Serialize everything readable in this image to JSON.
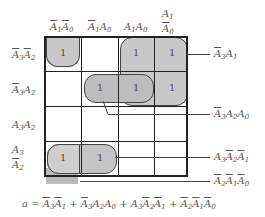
{
  "kmap": {
    "col_headers": [
      {
        "parts": [
          {
            "t": "A",
            "sub": "1",
            "bar": true
          },
          {
            "t": "A",
            "sub": "0",
            "bar": true
          }
        ]
      },
      {
        "parts": [
          {
            "t": "A",
            "sub": "1",
            "bar": true
          },
          {
            "t": "A",
            "sub": "0",
            "bar": false
          }
        ]
      },
      {
        "parts": [
          {
            "t": "A",
            "sub": "1",
            "bar": false
          },
          {
            "t": "A",
            "sub": "0",
            "bar": false
          }
        ]
      },
      {
        "parts": [
          {
            "t": "A",
            "sub": "1",
            "bar": false
          },
          {
            "t": "A",
            "sub": "0",
            "bar": true
          }
        ]
      }
    ],
    "row_headers": [
      {
        "parts": [
          {
            "t": "A",
            "sub": "3",
            "bar": true
          },
          {
            "t": "A",
            "sub": "2",
            "bar": true
          }
        ]
      },
      {
        "parts": [
          {
            "t": "A",
            "sub": "3",
            "bar": true
          },
          {
            "t": "A",
            "sub": "2",
            "bar": false
          }
        ]
      },
      {
        "parts": [
          {
            "t": "A",
            "sub": "3",
            "bar": false
          },
          {
            "t": "A",
            "sub": "2",
            "bar": false
          }
        ]
      },
      {
        "parts": [
          {
            "t": "A",
            "sub": "3",
            "bar": false
          },
          {
            "t": "A",
            "sub": "2",
            "bar": true
          }
        ]
      }
    ],
    "cells": [
      [
        "1",
        "",
        "1",
        "1"
      ],
      [
        "",
        "1",
        "1",
        "1"
      ],
      [
        "",
        "",
        "",
        ""
      ],
      [
        "1",
        "1",
        "",
        ""
      ]
    ],
    "groups": [
      {
        "term": "Ā3A1",
        "label_html": "A3 bar, A1"
      },
      {
        "term": "Ā3A2A0"
      },
      {
        "term": "A3Ā2Ā1"
      },
      {
        "term": "Ā2Ā1Ā0"
      }
    ],
    "one_value": "1"
  },
  "annotations": {
    "g1": "Ā3A1",
    "g2": "Ā3A2A0",
    "g3": "A3Ā2Ā1",
    "g4": "Ā2Ā1Ā0"
  },
  "equation": "a = Ā3Ā1 + Ā3A2A0 + A3Ā2Ā1 + Ā2Ā1Ā0"
}
